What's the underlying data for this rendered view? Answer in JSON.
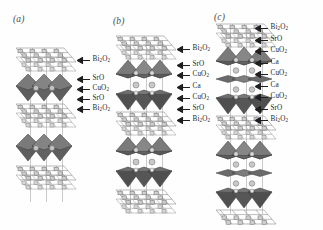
{
  "figure": {
    "background_color": "#fefefe",
    "ink_color": "#2b2b2b",
    "polyhedron_color": "#6f6f6f",
    "mesh_color": "#9a9a9a",
    "atom_color": "#b5b5b5",
    "style": "grayscale line drawing of layered cuprate crystal structures"
  },
  "panels": [
    {
      "tag": "(a)",
      "name": "panel-a",
      "layer_labels": [
        {
          "text": "Bi",
          "sub": "2",
          "text2": "O",
          "sub2": "2",
          "full": "Bi2O2"
        },
        {
          "text": "SrO",
          "sub": "",
          "text2": "",
          "sub2": "",
          "full": "SrO"
        },
        {
          "text": "CuO",
          "sub": "2",
          "text2": "",
          "sub2": "",
          "full": "CuO2"
        },
        {
          "text": "SrO",
          "sub": "",
          "text2": "",
          "sub2": "",
          "full": "SrO"
        },
        {
          "text": "Bi",
          "sub": "2",
          "text2": "O",
          "sub2": "2",
          "full": "Bi2O2"
        }
      ]
    },
    {
      "tag": "(b)",
      "name": "panel-b",
      "layer_labels": [
        {
          "text": "Bi",
          "sub": "2",
          "text2": "O",
          "sub2": "2",
          "full": "Bi2O2"
        },
        {
          "text": "SrO",
          "sub": "",
          "text2": "",
          "sub2": "",
          "full": "SrO"
        },
        {
          "text": "CuO",
          "sub": "2",
          "text2": "",
          "sub2": "",
          "full": "CuO2"
        },
        {
          "text": "Ca",
          "sub": "",
          "text2": "",
          "sub2": "",
          "full": "Ca"
        },
        {
          "text": "CuO",
          "sub": "2",
          "text2": "",
          "sub2": "",
          "full": "CuO2"
        },
        {
          "text": "SrO",
          "sub": "",
          "text2": "",
          "sub2": "",
          "full": "SrO"
        },
        {
          "text": "Bi",
          "sub": "2",
          "text2": "O",
          "sub2": "2",
          "full": "Bi2O2"
        }
      ]
    },
    {
      "tag": "(c)",
      "name": "panel-c",
      "layer_labels": [
        {
          "text": "Bi",
          "sub": "2",
          "text2": "O",
          "sub2": "2",
          "full": "Bi2O2"
        },
        {
          "text": "SrO",
          "sub": "",
          "text2": "",
          "sub2": "",
          "full": "SrO"
        },
        {
          "text": "CuO",
          "sub": "2",
          "text2": "",
          "sub2": "",
          "full": "CuO2"
        },
        {
          "text": "Ca",
          "sub": "",
          "text2": "",
          "sub2": "",
          "full": "Ca"
        },
        {
          "text": "CuO",
          "sub": "2",
          "text2": "",
          "sub2": "",
          "full": "CuO2"
        },
        {
          "text": "Ca",
          "sub": "",
          "text2": "",
          "sub2": "",
          "full": "Ca"
        },
        {
          "text": "CuO",
          "sub": "2",
          "text2": "",
          "sub2": "",
          "full": "CuO2"
        },
        {
          "text": "SrO",
          "sub": "",
          "text2": "",
          "sub2": "",
          "full": "SrO"
        },
        {
          "text": "Bi",
          "sub": "2",
          "text2": "O",
          "sub2": "2",
          "full": "Bi2O2"
        }
      ]
    }
  ]
}
